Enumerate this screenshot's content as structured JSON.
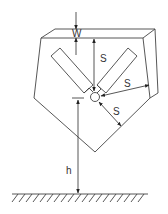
{
  "diagram": {
    "labels": {
      "w": "W",
      "s_vertical": "S",
      "s_right": "S",
      "s_diagonal": "S",
      "h": "h"
    },
    "colors": {
      "line": "#444444",
      "text": "#333333",
      "background": "#ffffff"
    }
  }
}
